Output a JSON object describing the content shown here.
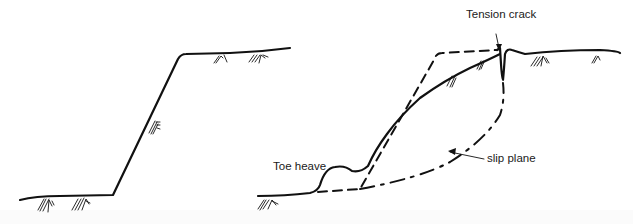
{
  "diagram": {
    "panels": [
      {
        "id": "left",
        "description": "Original stable slope profile with vegetation"
      },
      {
        "id": "right",
        "description": "Failed slope showing original profile (dashed), slumped surface and slip plane"
      }
    ],
    "labels": {
      "tension_crack": "Tension crack",
      "toe_heave": "Toe heave",
      "slip_plane": "slip plane"
    },
    "colors": {
      "line": "#111111",
      "background": "#ffffff"
    }
  }
}
